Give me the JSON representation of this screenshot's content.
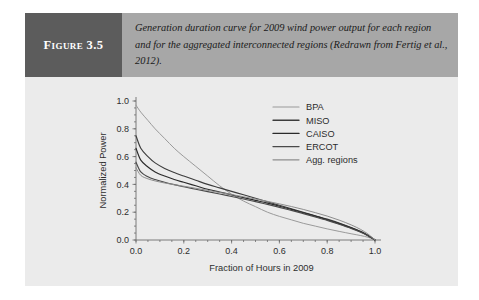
{
  "figure": {
    "label": "Figure 3.5",
    "caption": "Generation duration curve for 2009 wind power output for each region and for the aggregated interconnected regions (Redrawn from Fertig et al., 2012)."
  },
  "colors": {
    "header_band": "#a7a7a7",
    "label_block": "#5c5c5c",
    "panel_background": "#ebebeb",
    "axis": "#6d6d6d",
    "bpa": "#9a9a9a",
    "miso": "#3d3d3d",
    "caiso": "#2b2b2b",
    "ercot": "#4a4a4a",
    "agg_regions": "#8e8e8e"
  },
  "chart_data": {
    "type": "line",
    "title": "",
    "xlabel": "Fraction of Hours in 2009",
    "ylabel": "Normalized Power",
    "xlim": [
      0.0,
      1.0
    ],
    "ylim": [
      0.0,
      1.0
    ],
    "xticks": [
      "0.0",
      "0.2",
      "0.4",
      "0.6",
      "0.8",
      "1.0"
    ],
    "yticks": [
      "0.0",
      "0.2",
      "0.4",
      "0.6",
      "0.8",
      "1.0"
    ],
    "grid": false,
    "legend_position": "top-right",
    "x": [
      0.0,
      0.02,
      0.05,
      0.08,
      0.12,
      0.16,
      0.2,
      0.25,
      0.3,
      0.35,
      0.4,
      0.45,
      0.5,
      0.55,
      0.6,
      0.65,
      0.7,
      0.75,
      0.8,
      0.85,
      0.9,
      0.94,
      0.97,
      0.99,
      1.0
    ],
    "series": [
      {
        "name": "BPA",
        "color": "#9a9a9a",
        "width": 1.0,
        "values": [
          0.97,
          0.92,
          0.86,
          0.8,
          0.73,
          0.66,
          0.6,
          0.53,
          0.46,
          0.39,
          0.33,
          0.28,
          0.24,
          0.2,
          0.17,
          0.145,
          0.12,
          0.1,
          0.08,
          0.062,
          0.045,
          0.032,
          0.02,
          0.008,
          0.0
        ]
      },
      {
        "name": "MISO",
        "color": "#3d3d3d",
        "width": 1.15,
        "values": [
          0.75,
          0.66,
          0.6,
          0.555,
          0.515,
          0.485,
          0.46,
          0.43,
          0.4,
          0.375,
          0.35,
          0.325,
          0.3,
          0.275,
          0.25,
          0.225,
          0.2,
          0.175,
          0.15,
          0.122,
          0.09,
          0.062,
          0.035,
          0.012,
          0.0
        ]
      },
      {
        "name": "CAISO",
        "color": "#2b2b2b",
        "width": 1.15,
        "values": [
          0.66,
          0.575,
          0.525,
          0.49,
          0.46,
          0.435,
          0.415,
          0.39,
          0.365,
          0.345,
          0.325,
          0.305,
          0.285,
          0.265,
          0.243,
          0.22,
          0.196,
          0.172,
          0.146,
          0.118,
          0.087,
          0.059,
          0.033,
          0.011,
          0.0
        ]
      },
      {
        "name": "ERCOT",
        "color": "#4a4a4a",
        "width": 1.15,
        "values": [
          0.56,
          0.49,
          0.455,
          0.435,
          0.415,
          0.398,
          0.383,
          0.365,
          0.348,
          0.331,
          0.313,
          0.295,
          0.276,
          0.256,
          0.235,
          0.213,
          0.19,
          0.166,
          0.141,
          0.113,
          0.083,
          0.056,
          0.031,
          0.01,
          0.0
        ]
      },
      {
        "name": "Agg. regions",
        "color": "#8e8e8e",
        "width": 1.0,
        "values": [
          0.52,
          0.465,
          0.44,
          0.425,
          0.41,
          0.398,
          0.387,
          0.372,
          0.357,
          0.342,
          0.327,
          0.311,
          0.295,
          0.278,
          0.26,
          0.241,
          0.22,
          0.197,
          0.172,
          0.143,
          0.109,
          0.076,
          0.044,
          0.015,
          0.0
        ]
      }
    ]
  }
}
